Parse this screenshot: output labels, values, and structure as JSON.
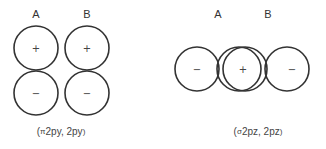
{
  "left_panel": {
    "labels": {
      "a": "A",
      "b": "B"
    },
    "signs": {
      "a_top": "+",
      "a_bottom": "−",
      "b_top": "+",
      "b_bottom": "−"
    },
    "caption": {
      "open": "(",
      "greek": "π",
      "text": "2py, 2py",
      "close": ")"
    }
  },
  "right_panel": {
    "labels": {
      "a": "A",
      "b": "B"
    },
    "signs": {
      "left": "−",
      "center": "+",
      "right": "−"
    },
    "caption": {
      "open": "(",
      "greek": "σ",
      "text": "2pz, 2pz",
      "close": ")"
    }
  }
}
